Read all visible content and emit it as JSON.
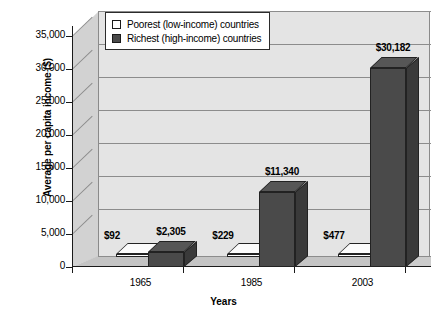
{
  "chart_data": {
    "type": "bar",
    "title": "",
    "xlabel": "Years",
    "ylabel": "Average per capita income ($)",
    "categories": [
      "1965",
      "1985",
      "2003"
    ],
    "series": [
      {
        "name": "Poorest (low-income) countries",
        "color": "#ffffff",
        "values": [
          92,
          229,
          477
        ],
        "labels": [
          "$92",
          "$229",
          "$477"
        ]
      },
      {
        "name": "Richest (high-income) countries",
        "color": "#4a4a4a",
        "values": [
          2305,
          11340,
          30182
        ],
        "labels": [
          "$2,305",
          "$11,340",
          "$30,182"
        ]
      }
    ],
    "ylim": [
      0,
      35000
    ],
    "ytick_values": [
      0,
      5000,
      10000,
      15000,
      20000,
      25000,
      30000,
      35000
    ],
    "ytick_labels": [
      "0",
      "5,000",
      "10,000",
      "15,000",
      "20,000",
      "25,000",
      "30,000",
      "35,000"
    ],
    "grid": true,
    "legend_position": "top-left",
    "projection": "3d"
  },
  "legend": {
    "items": [
      {
        "label": "Poorest (low-income) countries",
        "swatch": "#ffffff"
      },
      {
        "label": "Richest (high-income) countries",
        "swatch": "#4a4a4a"
      }
    ]
  },
  "caption": ""
}
